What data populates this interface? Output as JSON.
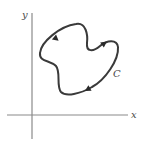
{
  "figure": {
    "type": "closed-curve-diagram",
    "axes": {
      "x_label": "x",
      "y_label": "y"
    },
    "curve": {
      "label": "C",
      "orientation": "counterclockwise",
      "arrow_count": 3
    },
    "colors": {
      "curve": "#3a3a3a",
      "axis": "#8a8a8a",
      "label": "#4a4a4a",
      "background": "#ffffff"
    }
  }
}
